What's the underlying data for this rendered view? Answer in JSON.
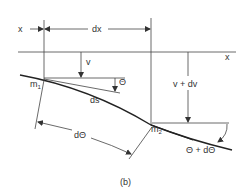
{
  "diagram": {
    "caption": "(b)",
    "labels": {
      "x_left": "x",
      "dx": "dx",
      "x_axis": "x",
      "v": "v",
      "v_plus_dv": "v + dv",
      "theta": "Θ",
      "m1": "m",
      "m1_sub": "1",
      "m2": "m",
      "m2_sub": "2",
      "ds": "ds",
      "d_theta": "dΘ",
      "theta_plus_d_theta": "Θ + dΘ"
    },
    "colors": {
      "line": "#333333",
      "background": "#ffffff"
    }
  }
}
